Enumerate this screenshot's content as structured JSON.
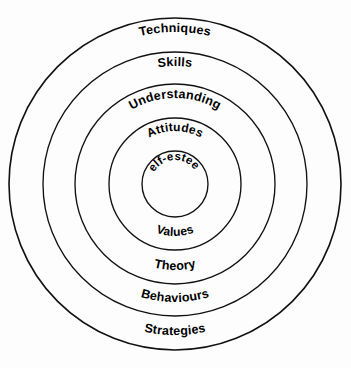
{
  "diagram": {
    "type": "concentric-circles",
    "title": "",
    "background_color": "#fdfdfd",
    "stroke_color": "#111111",
    "text_color": "#000000",
    "center": {
      "x": 175,
      "y": 184
    },
    "rings": [
      {
        "index": 0,
        "name": "techniques",
        "label": "Techniques",
        "radius": 166,
        "position": "top",
        "font_size": 12.5
      },
      {
        "index": 1,
        "name": "skills",
        "label": "Skills",
        "radius": 132,
        "position": "top",
        "font_size": 12.5
      },
      {
        "index": 2,
        "name": "understanding",
        "label": "Understanding",
        "radius": 100,
        "position": "top",
        "font_size": 12.5
      },
      {
        "index": 3,
        "name": "attitudes",
        "label": "Attitudes",
        "radius": 66,
        "position": "top",
        "font_size": 12
      },
      {
        "index": 4,
        "name": "self-esteem",
        "label": "Self-esteem",
        "radius": 33,
        "position": "center",
        "font_size": 11.5
      }
    ],
    "lower_labels": [
      {
        "index": 0,
        "name": "values",
        "label": "Values",
        "radius": 66,
        "position": "bottom",
        "font_size": 12
      },
      {
        "index": 1,
        "name": "theory",
        "label": "Theory",
        "radius": 100,
        "position": "bottom",
        "font_size": 12.5
      },
      {
        "index": 2,
        "name": "behaviours",
        "label": "Behaviours",
        "radius": 132,
        "position": "bottom",
        "font_size": 12.5
      },
      {
        "index": 3,
        "name": "strategies",
        "label": "Strategies",
        "radius": 166,
        "position": "bottom",
        "font_size": 12.5
      }
    ]
  }
}
